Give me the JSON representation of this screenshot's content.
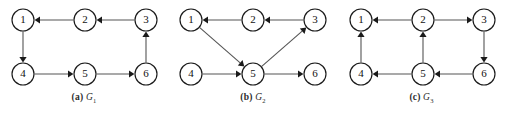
{
  "figure": {
    "width": 505,
    "height": 113,
    "background": "#ffffff",
    "node_radius": 11,
    "node_stroke": "#1a1a1a",
    "edge_color": "#555555",
    "arrow_color": "#1a1a1a"
  },
  "panels": [
    {
      "id": "panel-a",
      "left": 0,
      "width": 168,
      "caption_tag": "(a)",
      "caption_name": "G",
      "caption_sub": "1",
      "caption_top": 92,
      "nodes": [
        {
          "id": "1",
          "label": "1",
          "x": 23,
          "y": 20
        },
        {
          "id": "2",
          "label": "2",
          "x": 85,
          "y": 20
        },
        {
          "id": "3",
          "label": "3",
          "x": 146,
          "y": 20
        },
        {
          "id": "4",
          "label": "4",
          "x": 23,
          "y": 74
        },
        {
          "id": "5",
          "label": "5",
          "x": 85,
          "y": 74
        },
        {
          "id": "6",
          "label": "6",
          "x": 146,
          "y": 74
        }
      ],
      "edges": [
        {
          "from": "2",
          "to": "1"
        },
        {
          "from": "3",
          "to": "2"
        },
        {
          "from": "1",
          "to": "4"
        },
        {
          "from": "4",
          "to": "5"
        },
        {
          "from": "5",
          "to": "6"
        },
        {
          "from": "6",
          "to": "3"
        }
      ]
    },
    {
      "id": "panel-b",
      "left": 168,
      "width": 170,
      "caption_tag": "(b)",
      "caption_name": "G",
      "caption_sub": "2",
      "caption_top": 92,
      "nodes": [
        {
          "id": "1",
          "label": "1",
          "x": 23,
          "y": 20
        },
        {
          "id": "2",
          "label": "2",
          "x": 85,
          "y": 20
        },
        {
          "id": "3",
          "label": "3",
          "x": 147,
          "y": 20
        },
        {
          "id": "4",
          "label": "4",
          "x": 23,
          "y": 74
        },
        {
          "id": "5",
          "label": "5",
          "x": 85,
          "y": 74
        },
        {
          "id": "6",
          "label": "6",
          "x": 147,
          "y": 74
        }
      ],
      "edges": [
        {
          "from": "2",
          "to": "1"
        },
        {
          "from": "3",
          "to": "2"
        },
        {
          "from": "1",
          "to": "5"
        },
        {
          "from": "5",
          "to": "3"
        },
        {
          "from": "4",
          "to": "5"
        },
        {
          "from": "5",
          "to": "6"
        }
      ]
    },
    {
      "id": "panel-c",
      "left": 338,
      "width": 167,
      "caption_tag": "(c)",
      "caption_name": "G",
      "caption_sub": "3",
      "caption_top": 92,
      "nodes": [
        {
          "id": "1",
          "label": "1",
          "x": 23,
          "y": 20
        },
        {
          "id": "2",
          "label": "2",
          "x": 85,
          "y": 20
        },
        {
          "id": "3",
          "label": "3",
          "x": 146,
          "y": 20
        },
        {
          "id": "4",
          "label": "4",
          "x": 23,
          "y": 74
        },
        {
          "id": "5",
          "label": "5",
          "x": 85,
          "y": 74
        },
        {
          "id": "6",
          "label": "6",
          "x": 146,
          "y": 74
        }
      ],
      "edges": [
        {
          "from": "2",
          "to": "1"
        },
        {
          "from": "2",
          "to": "3"
        },
        {
          "from": "4",
          "to": "1"
        },
        {
          "from": "5",
          "to": "2"
        },
        {
          "from": "3",
          "to": "6"
        },
        {
          "from": "5",
          "to": "4"
        },
        {
          "from": "6",
          "to": "5"
        }
      ]
    }
  ]
}
